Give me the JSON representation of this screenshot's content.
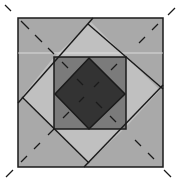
{
  "diagram": {
    "colors": {
      "background": "#ffffff",
      "outer_square": "#a9a9a9",
      "light_triangles": "#c0c0c0",
      "inner_square": "#7b7b7b",
      "inner_diamond": "#333333",
      "stroke": "#1a1a1a",
      "highlight_line": "#e8e8e8"
    },
    "components": [
      {
        "id": "outer-square",
        "label": "outer square"
      },
      {
        "id": "pinwheel-lines",
        "label": "four overlapping diagonal lines"
      },
      {
        "id": "inner-square",
        "label": "inner square"
      },
      {
        "id": "inner-diamond",
        "label": "inner diamond"
      },
      {
        "id": "diagonal-dashes",
        "label": "dashed diagonals through corners"
      }
    ]
  }
}
